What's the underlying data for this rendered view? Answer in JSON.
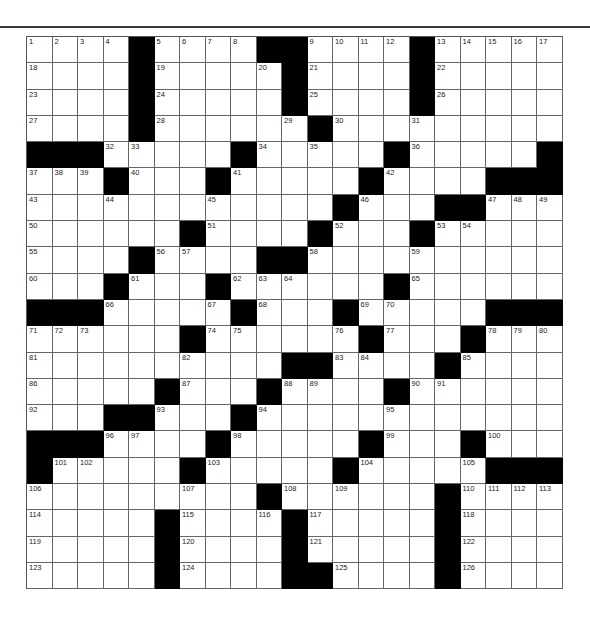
{
  "puzzle": {
    "rows": 21,
    "cols": 21,
    "grid": [
      [
        "1",
        "2",
        "3",
        "4",
        "#",
        "5",
        "6",
        "7",
        "8",
        "#",
        "#",
        "9",
        "10",
        "11",
        "12",
        "#",
        "13",
        "14",
        "15",
        "16",
        "17"
      ],
      [
        "18",
        "",
        "",
        "",
        "#",
        "19",
        "",
        "",
        "",
        "20",
        "#",
        "21",
        "",
        "",
        "",
        "#",
        "22",
        "",
        "",
        "",
        ""
      ],
      [
        "23",
        "",
        "",
        "",
        "#",
        "24",
        "",
        "",
        "",
        "",
        "#",
        "25",
        "",
        "",
        "",
        "#",
        "26",
        "",
        "",
        "",
        ""
      ],
      [
        "27",
        "",
        "",
        "",
        "#",
        "28",
        "",
        "",
        "",
        "",
        "29",
        "#",
        "30",
        "",
        "",
        "31",
        "",
        "",
        "",
        "",
        ""
      ],
      [
        "#",
        "#",
        "#",
        "32",
        "33",
        "",
        "",
        "",
        "#",
        "34",
        "",
        "35",
        "",
        "",
        "#",
        "36",
        "",
        "",
        "",
        "",
        "#"
      ],
      [
        "37",
        "38",
        "39",
        "#",
        "40",
        "",
        "",
        "#",
        "41",
        "",
        "",
        "",
        "",
        "#",
        "42",
        "",
        "",
        "",
        "#",
        "#",
        "#"
      ],
      [
        "43",
        "",
        "",
        "44",
        "",
        "",
        "",
        "45",
        "",
        "",
        "",
        "",
        "#",
        "46",
        "",
        "",
        "#",
        "#",
        "47",
        "48",
        "49"
      ],
      [
        "50",
        "",
        "",
        "",
        "",
        "",
        "#",
        "51",
        "",
        "",
        "",
        "#",
        "52",
        "",
        "",
        "#",
        "53",
        "54",
        "",
        "",
        ""
      ],
      [
        "55",
        "",
        "",
        "",
        "#",
        "56",
        "57",
        "",
        "",
        "#",
        "#",
        "58",
        "",
        "",
        "",
        "59",
        "",
        "",
        "",
        "",
        ""
      ],
      [
        "60",
        "",
        "",
        "#",
        "61",
        "",
        "",
        "#",
        "62",
        "63",
        "64",
        "",
        "",
        "",
        "#",
        "65",
        "",
        "",
        "",
        "",
        ""
      ],
      [
        "#",
        "#",
        "#",
        "66",
        "",
        "",
        "",
        "67",
        "#",
        "68",
        "",
        "",
        "#",
        "69",
        "70",
        "",
        "",
        "",
        "#",
        "#",
        "#"
      ],
      [
        "71",
        "72",
        "73",
        "",
        "",
        "",
        "#",
        "74",
        "75",
        "",
        "",
        "",
        "76",
        "#",
        "77",
        "",
        "",
        "#",
        "78",
        "79",
        "80"
      ],
      [
        "81",
        "",
        "",
        "",
        "",
        "",
        "82",
        "",
        "",
        "",
        "#",
        "#",
        "83",
        "84",
        "",
        "",
        "#",
        "85",
        "",
        "",
        ""
      ],
      [
        "86",
        "",
        "",
        "",
        "",
        "#",
        "87",
        "",
        "",
        "#",
        "88",
        "89",
        "",
        "",
        "#",
        "90",
        "91",
        "",
        "",
        "",
        ""
      ],
      [
        "92",
        "",
        "",
        "#",
        "#",
        "93",
        "",
        "",
        "#",
        "94",
        "",
        "",
        "",
        "",
        "95",
        "",
        "",
        "",
        "",
        "",
        ""
      ],
      [
        "#",
        "#",
        "#",
        "96",
        "97",
        "",
        "",
        "#",
        "98",
        "",
        "",
        "",
        "",
        "#",
        "99",
        "",
        "",
        "#",
        "100",
        "",
        ""
      ],
      [
        "#",
        "101",
        "102",
        "",
        "",
        "",
        "#",
        "103",
        "",
        "",
        "",
        "",
        "#",
        "104",
        "",
        "",
        "",
        "105",
        "#",
        "#",
        "#"
      ],
      [
        "106",
        "",
        "",
        "",
        "",
        "",
        "107",
        "",
        "",
        "#",
        "108",
        "",
        "109",
        "",
        "",
        "",
        "#",
        "110",
        "111",
        "112",
        "113"
      ],
      [
        "114",
        "",
        "",
        "",
        "",
        "#",
        "115",
        "",
        "",
        "116",
        "#",
        "117",
        "",
        "",
        "",
        "",
        "#",
        "118",
        "",
        "",
        ""
      ],
      [
        "119",
        "",
        "",
        "",
        "",
        "#",
        "120",
        "",
        "",
        "",
        "#",
        "121",
        "",
        "",
        "",
        "",
        "#",
        "122",
        "",
        "",
        ""
      ],
      [
        "123",
        "",
        "",
        "",
        "",
        "#",
        "124",
        "",
        "",
        "",
        "#",
        "#",
        "125",
        "",
        "",
        "",
        "#",
        "126",
        "",
        "",
        ""
      ]
    ]
  },
  "colors": {
    "block": "#000000",
    "cell": "#ffffff",
    "rule": "#3a3a3a"
  }
}
